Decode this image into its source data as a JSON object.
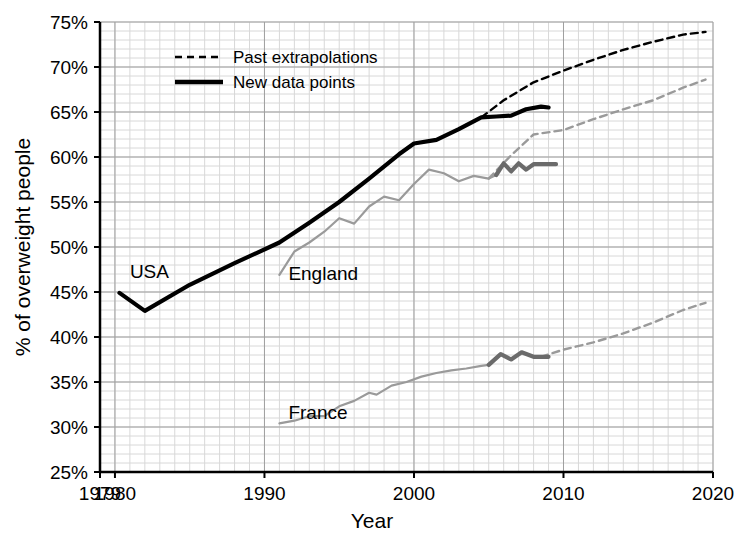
{
  "chart_data": {
    "type": "line",
    "title": "",
    "xlabel": "Year",
    "ylabel": "% of overweight people",
    "xlim": [
      1979,
      2020
    ],
    "ylim": [
      25,
      75
    ],
    "xticks": [
      "1979",
      "1980",
      "1990",
      "2000",
      "2010",
      "2020"
    ],
    "xtick_values": [
      1979,
      1980,
      1990,
      2000,
      2010,
      2020
    ],
    "yticks": [
      "25%",
      "30%",
      "35%",
      "40%",
      "45%",
      "50%",
      "55%",
      "60%",
      "65%",
      "70%",
      "75%"
    ],
    "ytick_values": [
      25,
      30,
      35,
      40,
      45,
      50,
      55,
      60,
      65,
      70,
      75
    ],
    "grid": true,
    "legend": {
      "position": "top-left",
      "entries": [
        {
          "label": "Past extrapolations",
          "style": "dashed",
          "color": "#000000"
        },
        {
          "label": "New data points",
          "style": "solid-thick",
          "color": "#000000"
        }
      ]
    },
    "annotations": [
      {
        "text": "USA",
        "x": 1981.0,
        "y": 46.6
      },
      {
        "text": "England",
        "x": 1991.6,
        "y": 46.3
      },
      {
        "text": "France",
        "x": 1991.6,
        "y": 30.9
      }
    ],
    "series": [
      {
        "name": "USA",
        "color": "#000000",
        "style": "solid-thick",
        "points": [
          [
            1980.3,
            44.9
          ],
          [
            1982.0,
            42.9
          ],
          [
            1985.0,
            45.8
          ],
          [
            1988.0,
            48.2
          ],
          [
            1991.0,
            50.5
          ],
          [
            1993.0,
            52.7
          ],
          [
            1995.0,
            55.0
          ],
          [
            1997.0,
            57.6
          ],
          [
            1999.0,
            60.3
          ],
          [
            2000.0,
            61.5
          ],
          [
            2001.5,
            61.9
          ],
          [
            2003.0,
            63.1
          ],
          [
            2004.5,
            64.4
          ],
          [
            2005.5,
            64.5
          ],
          [
            2006.5,
            64.6
          ],
          [
            2007.5,
            65.3
          ],
          [
            2008.5,
            65.6
          ],
          [
            2009.0,
            65.5
          ]
        ]
      },
      {
        "name": "USA extrapolation",
        "color": "#000000",
        "style": "dashed",
        "points": [
          [
            2004.5,
            64.4
          ],
          [
            2006.0,
            66.3
          ],
          [
            2008.0,
            68.3
          ],
          [
            2010.0,
            69.6
          ],
          [
            2012.0,
            70.8
          ],
          [
            2014.0,
            71.9
          ],
          [
            2016.0,
            72.8
          ],
          [
            2018.0,
            73.6
          ],
          [
            2019.5,
            73.9
          ]
        ]
      },
      {
        "name": "England",
        "color": "#9a9a9a",
        "style": "solid",
        "points": [
          [
            1991.0,
            46.9
          ],
          [
            1992.0,
            49.5
          ],
          [
            1993.0,
            50.5
          ],
          [
            1994.0,
            51.7
          ],
          [
            1995.0,
            53.2
          ],
          [
            1996.0,
            52.6
          ],
          [
            1997.0,
            54.5
          ],
          [
            1998.0,
            55.6
          ],
          [
            1999.0,
            55.2
          ],
          [
            2000.0,
            57.0
          ],
          [
            2001.0,
            58.6
          ],
          [
            2002.0,
            58.2
          ],
          [
            2003.0,
            57.3
          ],
          [
            2004.0,
            57.9
          ],
          [
            2005.0,
            57.6
          ],
          [
            2005.5,
            58.0
          ]
        ]
      },
      {
        "name": "England new data",
        "color": "#6b6b6b",
        "style": "solid-thick",
        "points": [
          [
            2005.5,
            58.0
          ],
          [
            2006.0,
            59.3
          ],
          [
            2006.5,
            58.4
          ],
          [
            2007.0,
            59.3
          ],
          [
            2007.5,
            58.6
          ],
          [
            2008.0,
            59.2
          ],
          [
            2009.0,
            59.2
          ],
          [
            2009.5,
            59.2
          ]
        ]
      },
      {
        "name": "England extrapolation",
        "color": "#9a9a9a",
        "style": "dashed",
        "points": [
          [
            2005.0,
            57.6
          ],
          [
            2006.5,
            60.2
          ],
          [
            2008.0,
            62.5
          ],
          [
            2010.0,
            63.0
          ],
          [
            2012.0,
            64.2
          ],
          [
            2014.0,
            65.3
          ],
          [
            2016.0,
            66.3
          ],
          [
            2018.0,
            67.7
          ],
          [
            2019.5,
            68.6
          ]
        ]
      },
      {
        "name": "France",
        "color": "#9a9a9a",
        "style": "solid",
        "points": [
          [
            1991.0,
            30.4
          ],
          [
            1992.0,
            30.7
          ],
          [
            1993.0,
            31.2
          ],
          [
            1994.0,
            31.2
          ],
          [
            1995.0,
            32.3
          ],
          [
            1996.0,
            32.9
          ],
          [
            1997.0,
            33.8
          ],
          [
            1997.5,
            33.6
          ],
          [
            1998.5,
            34.6
          ],
          [
            1999.5,
            35.0
          ],
          [
            2000.5,
            35.6
          ],
          [
            2001.5,
            36.0
          ],
          [
            2002.5,
            36.3
          ],
          [
            2003.5,
            36.5
          ],
          [
            2004.5,
            36.8
          ],
          [
            2005.0,
            36.9
          ]
        ]
      },
      {
        "name": "France new data",
        "color": "#6b6b6b",
        "style": "solid-thick",
        "points": [
          [
            2005.0,
            36.9
          ],
          [
            2005.8,
            38.1
          ],
          [
            2006.5,
            37.5
          ],
          [
            2007.2,
            38.3
          ],
          [
            2008.0,
            37.8
          ],
          [
            2009.0,
            37.8
          ]
        ]
      },
      {
        "name": "France extrapolation",
        "color": "#9a9a9a",
        "style": "dashed",
        "points": [
          [
            2008.5,
            37.8
          ],
          [
            2010.0,
            38.6
          ],
          [
            2012.0,
            39.4
          ],
          [
            2014.0,
            40.4
          ],
          [
            2016.0,
            41.6
          ],
          [
            2018.0,
            43.0
          ],
          [
            2019.5,
            43.8
          ]
        ]
      }
    ]
  }
}
